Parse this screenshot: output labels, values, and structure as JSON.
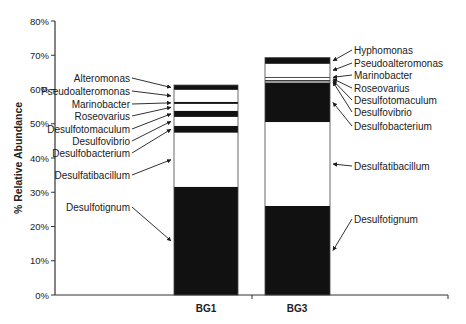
{
  "chart_data": {
    "type": "bar",
    "stacked": true,
    "title": "",
    "xlabel": "",
    "ylabel": "% Relative Abundance",
    "ylim": [
      0,
      80
    ],
    "yticks": [
      "0%",
      "10%",
      "20%",
      "30%",
      "40%",
      "50%",
      "60%",
      "70%",
      "80%"
    ],
    "grid": false,
    "categories": [
      "BG1",
      "BG3"
    ],
    "stacks": [
      {
        "category": "BG1",
        "segments": [
          {
            "name": "Desulfotignum",
            "value": 31.6,
            "fill": "#111111"
          },
          {
            "name": "Desulfatibacillum",
            "value": 15.8,
            "fill": "#ffffff"
          },
          {
            "name": "Desulfobacterium",
            "value": 2.0,
            "fill": "#111111"
          },
          {
            "name": "Desulfovibrio",
            "value": 2.6,
            "fill": "#ffffff"
          },
          {
            "name": "Desulfotomaculum",
            "value": 1.8,
            "fill": "#111111"
          },
          {
            "name": "Roseovarius",
            "value": 2.0,
            "fill": "#ffffff"
          },
          {
            "name": "Marinobacter",
            "value": 0.6,
            "fill": "#111111"
          },
          {
            "name": "Pseudoalteromonas",
            "value": 3.5,
            "fill": "#ffffff"
          },
          {
            "name": "Alteromonas",
            "value": 1.4,
            "fill": "#111111"
          }
        ]
      },
      {
        "category": "BG3",
        "segments": [
          {
            "name": "Desulfotignum",
            "value": 26.0,
            "fill": "#111111"
          },
          {
            "name": "Desulfatibacillum",
            "value": 24.5,
            "fill": "#ffffff"
          },
          {
            "name": "Desulfobacterium",
            "value": 11.4,
            "fill": "#111111"
          },
          {
            "name": "Desulfovibrio",
            "value": 0.6,
            "fill": "#999999"
          },
          {
            "name": "Desulfotomaculum",
            "value": 0.3,
            "fill": "#333333"
          },
          {
            "name": "Roseovarius",
            "value": 0.6,
            "fill": "#ffffff"
          },
          {
            "name": "Marinobacter",
            "value": 0.3,
            "fill": "#333333"
          },
          {
            "name": "Pseudoalteromonas",
            "value": 3.8,
            "fill": "#ffffff"
          },
          {
            "name": "Hyphomonas",
            "value": 1.8,
            "fill": "#111111"
          }
        ]
      }
    ],
    "annotations": {
      "BG1_left_labels": [
        {
          "text": "Alteromonas",
          "y": 78
        },
        {
          "text": "Pseudoalteromonas",
          "y": 91
        },
        {
          "text": "Marinobacter",
          "y": 104
        },
        {
          "text": "Roseovarius",
          "y": 116
        },
        {
          "text": "Desulfotomaculum",
          "y": 129
        },
        {
          "text": "Desulfovibrio",
          "y": 141
        },
        {
          "text": "Desulfobacterium",
          "y": 153
        },
        {
          "text": "Desulfatibacillum",
          "y": 175
        },
        {
          "text": "Desulfotignum",
          "y": 207
        }
      ],
      "BG3_right_labels": [
        {
          "text": "Hyphomonas",
          "y": 50
        },
        {
          "text": "Pseudoalteromonas",
          "y": 63
        },
        {
          "text": "Marinobacter",
          "y": 75
        },
        {
          "text": "Roseovarius",
          "y": 88
        },
        {
          "text": "Desulfotomaculum",
          "y": 100
        },
        {
          "text": "Desulfovibrio",
          "y": 112
        },
        {
          "text": "Desulfobacterium",
          "y": 126
        },
        {
          "text": "Desulfatibacillum",
          "y": 166
        },
        {
          "text": "Desulfotignum",
          "y": 219
        }
      ]
    }
  }
}
